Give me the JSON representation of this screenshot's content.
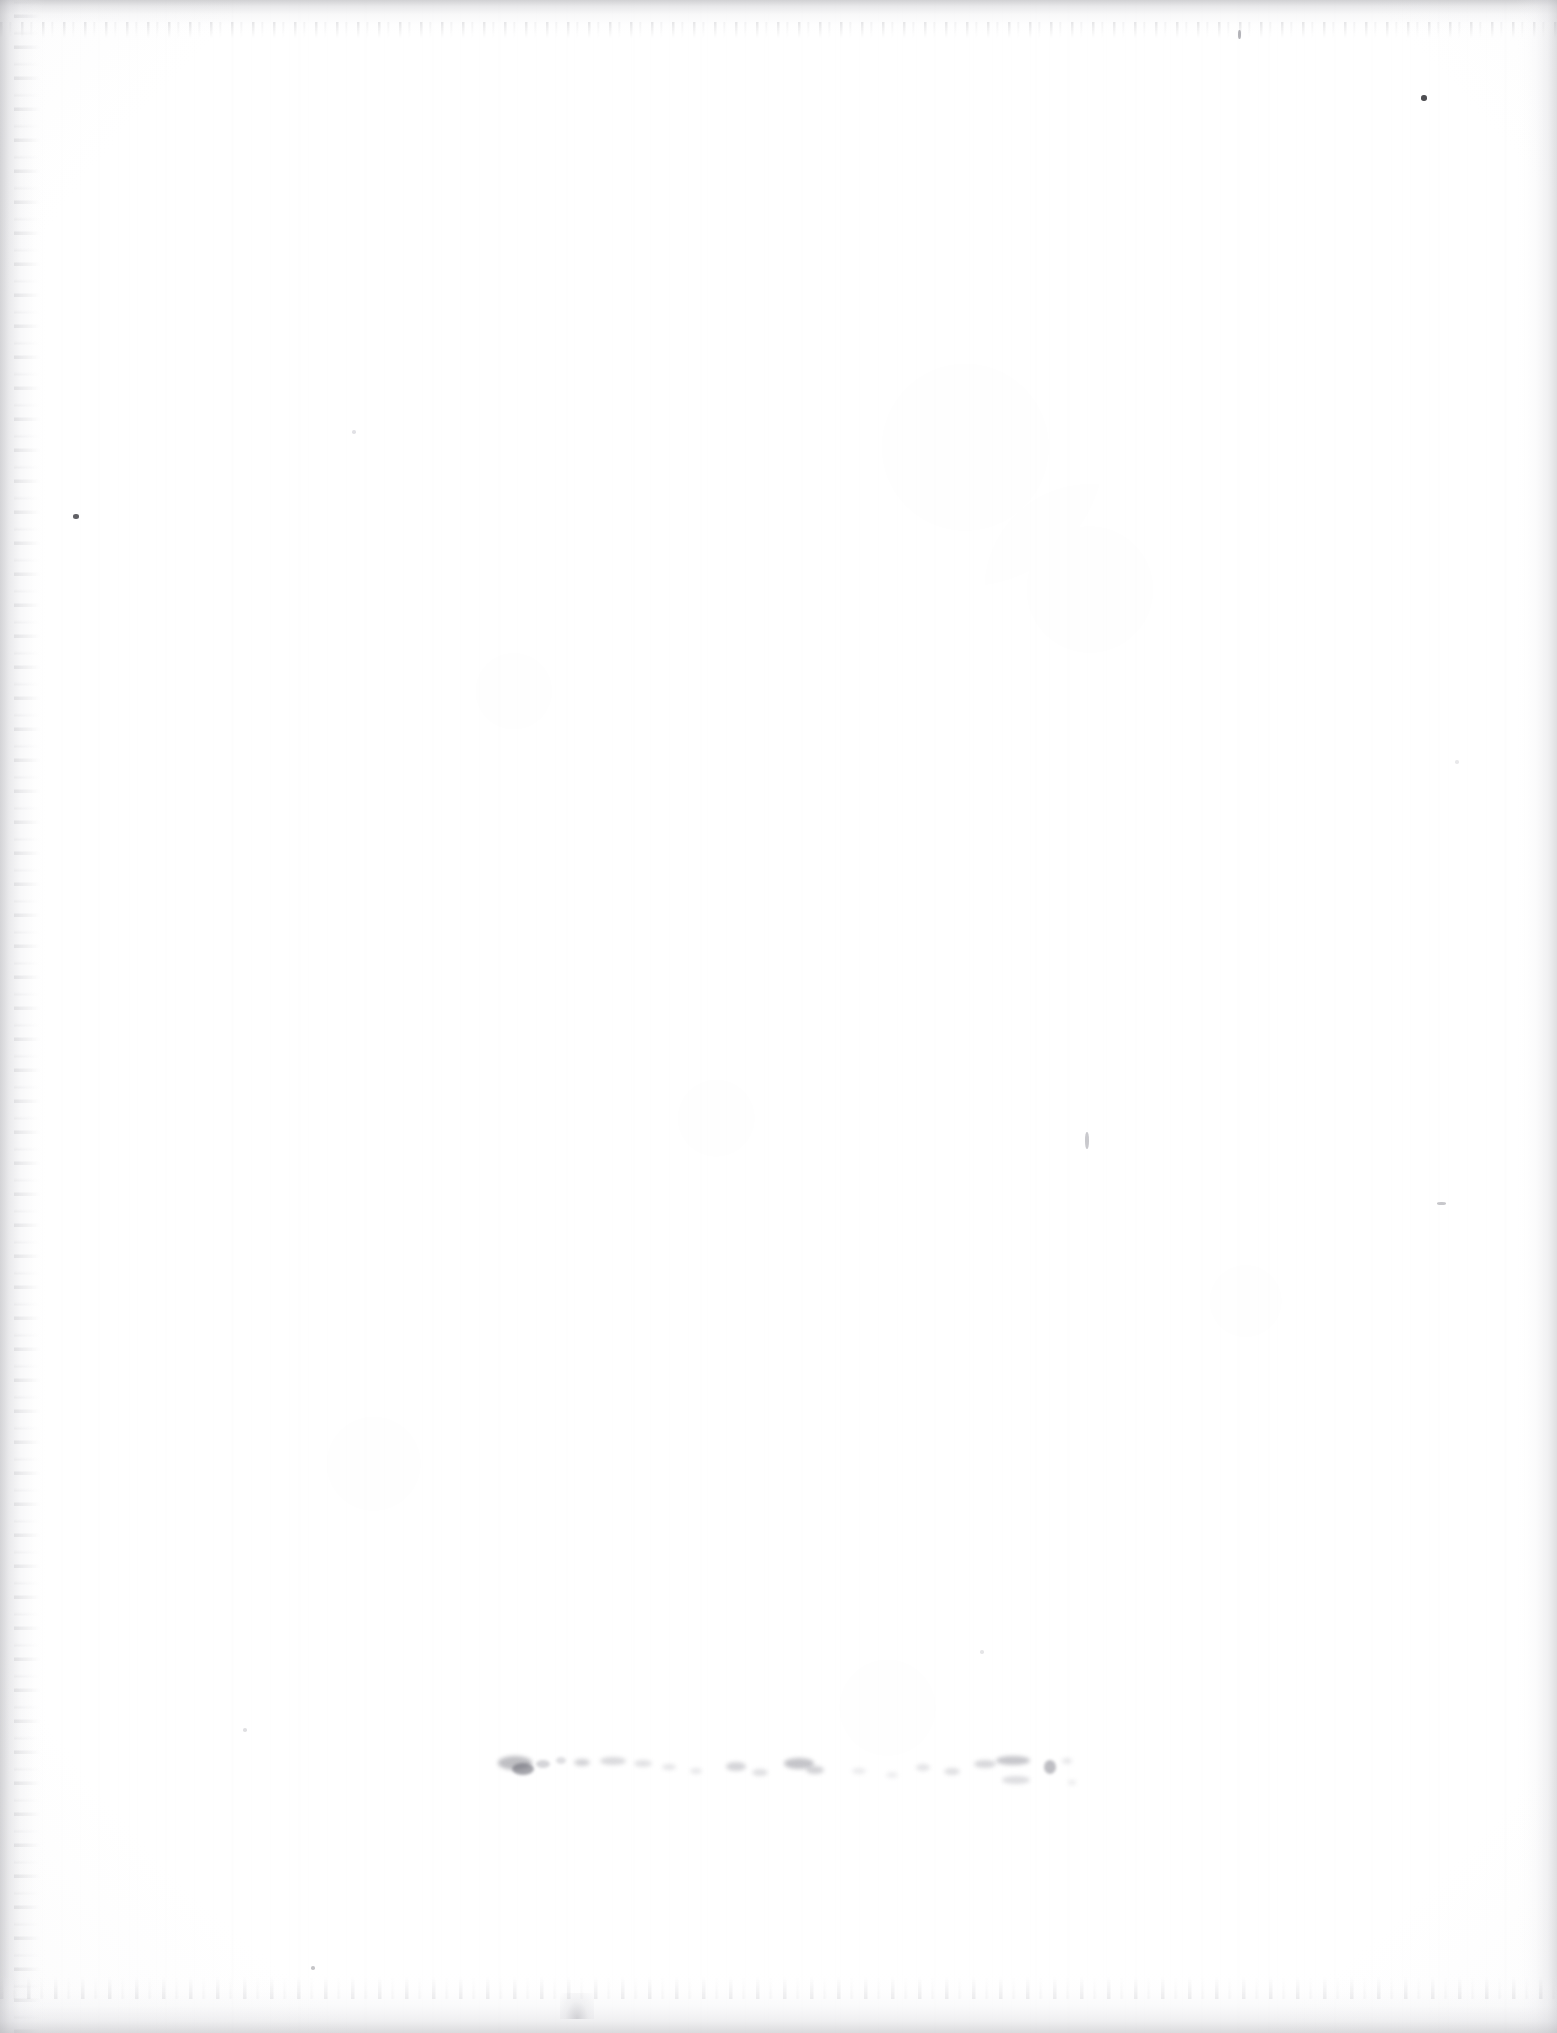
{
  "document": {
    "kind": "scanned-page",
    "page_content_text": "",
    "body_text": "",
    "is_blank": true,
    "width_px": 1557,
    "height_px": 2033,
    "background_color": "#fdfdfd",
    "paper_color": "#ffffff",
    "edge_shadow_color": "#b4b4b8",
    "ink_color": "#8e8e93",
    "dark_speck_color": "#2e2e33"
  },
  "artifacts": {
    "smudge_line": {
      "name": "bleed-through-smudge",
      "legible": false,
      "transcription": "",
      "description_text": "",
      "x_start": 498,
      "x_end": 1062,
      "y_center": 1768,
      "color": "#9a9aa0"
    },
    "specks": [
      {
        "name": "speck-top-right-dot",
        "x": 1421,
        "y": 95,
        "w": 6,
        "h": 6,
        "color": "#2f2f34",
        "opacity": 0.85
      },
      {
        "name": "speck-top-right-tick",
        "x": 1238,
        "y": 30,
        "w": 3,
        "h": 9,
        "color": "#9b9ba1",
        "opacity": 0.75
      },
      {
        "name": "speck-left-margin",
        "x": 73,
        "y": 514,
        "w": 6,
        "h": 5,
        "color": "#3a3a40",
        "opacity": 0.8
      },
      {
        "name": "speck-mid-right-stroke",
        "x": 1085,
        "y": 1132,
        "w": 4,
        "h": 17,
        "color": "#b2b2b8",
        "opacity": 0.7
      },
      {
        "name": "speck-right-dash",
        "x": 1437,
        "y": 1202,
        "w": 9,
        "h": 3,
        "color": "#a9a9af",
        "opacity": 0.65
      },
      {
        "name": "speck-upper-left-faint",
        "x": 352,
        "y": 430,
        "w": 4,
        "h": 4,
        "color": "#c9c9cf",
        "opacity": 0.55
      },
      {
        "name": "speck-lower-left-faint",
        "x": 243,
        "y": 1728,
        "w": 4,
        "h": 4,
        "color": "#c4c4ca",
        "opacity": 0.55
      },
      {
        "name": "speck-lower-mid-faint",
        "x": 980,
        "y": 1650,
        "w": 4,
        "h": 4,
        "color": "#cccccf",
        "opacity": 0.5
      },
      {
        "name": "speck-bottom-left-dot",
        "x": 311,
        "y": 1966,
        "w": 4,
        "h": 4,
        "color": "#9e9ea4",
        "opacity": 0.6
      },
      {
        "name": "speck-right-mid-faint",
        "x": 1455,
        "y": 760,
        "w": 4,
        "h": 4,
        "color": "#d2d2d6",
        "opacity": 0.5
      }
    ],
    "smudge_blobs": [
      {
        "x": 498,
        "y": 1756,
        "w": 34,
        "h": 14,
        "color": "#8a8a92",
        "opacity": 0.55,
        "blur": 2.0
      },
      {
        "x": 512,
        "y": 1763,
        "w": 22,
        "h": 12,
        "color": "#70707a",
        "opacity": 0.62,
        "blur": 1.6
      },
      {
        "x": 536,
        "y": 1760,
        "w": 14,
        "h": 8,
        "color": "#a2a2aa",
        "opacity": 0.45,
        "blur": 1.8
      },
      {
        "x": 556,
        "y": 1757,
        "w": 10,
        "h": 7,
        "color": "#aeaeb5",
        "opacity": 0.4,
        "blur": 1.8
      },
      {
        "x": 574,
        "y": 1759,
        "w": 16,
        "h": 7,
        "color": "#9b9ba3",
        "opacity": 0.45,
        "blur": 2.0
      },
      {
        "x": 600,
        "y": 1757,
        "w": 26,
        "h": 8,
        "color": "#a6a6ad",
        "opacity": 0.42,
        "blur": 2.2
      },
      {
        "x": 634,
        "y": 1760,
        "w": 18,
        "h": 7,
        "color": "#b0b0b7",
        "opacity": 0.38,
        "blur": 2.2
      },
      {
        "x": 662,
        "y": 1764,
        "w": 14,
        "h": 6,
        "color": "#b6b6bd",
        "opacity": 0.36,
        "blur": 2.0
      },
      {
        "x": 690,
        "y": 1768,
        "w": 12,
        "h": 6,
        "color": "#bcbcc2",
        "opacity": 0.34,
        "blur": 2.0
      },
      {
        "x": 726,
        "y": 1762,
        "w": 20,
        "h": 9,
        "color": "#9e9ea6",
        "opacity": 0.44,
        "blur": 2.2
      },
      {
        "x": 752,
        "y": 1769,
        "w": 16,
        "h": 7,
        "color": "#acacb3",
        "opacity": 0.38,
        "blur": 2.0
      },
      {
        "x": 784,
        "y": 1758,
        "w": 30,
        "h": 11,
        "color": "#8f8f98",
        "opacity": 0.52,
        "blur": 2.0
      },
      {
        "x": 806,
        "y": 1766,
        "w": 18,
        "h": 8,
        "color": "#9a9aa2",
        "opacity": 0.44,
        "blur": 2.0
      },
      {
        "x": 852,
        "y": 1768,
        "w": 14,
        "h": 6,
        "color": "#c0c0c6",
        "opacity": 0.32,
        "blur": 2.0
      },
      {
        "x": 886,
        "y": 1772,
        "w": 12,
        "h": 6,
        "color": "#c4c4ca",
        "opacity": 0.3,
        "blur": 2.0
      },
      {
        "x": 916,
        "y": 1764,
        "w": 14,
        "h": 7,
        "color": "#b4b4bb",
        "opacity": 0.36,
        "blur": 2.0
      },
      {
        "x": 944,
        "y": 1768,
        "w": 16,
        "h": 7,
        "color": "#adadb4",
        "opacity": 0.38,
        "blur": 2.0
      },
      {
        "x": 974,
        "y": 1760,
        "w": 22,
        "h": 8,
        "color": "#a0a0a8",
        "opacity": 0.42,
        "blur": 2.2
      },
      {
        "x": 996,
        "y": 1756,
        "w": 34,
        "h": 9,
        "color": "#8e8e97",
        "opacity": 0.5,
        "blur": 2.0
      },
      {
        "x": 1002,
        "y": 1776,
        "w": 28,
        "h": 8,
        "color": "#a8a8b0",
        "opacity": 0.38,
        "blur": 2.2
      },
      {
        "x": 1044,
        "y": 1760,
        "w": 12,
        "h": 14,
        "color": "#83838d",
        "opacity": 0.52,
        "blur": 1.8
      },
      {
        "x": 1062,
        "y": 1758,
        "w": 10,
        "h": 6,
        "color": "#b8b8be",
        "opacity": 0.34,
        "blur": 2.0
      },
      {
        "x": 1068,
        "y": 1780,
        "w": 8,
        "h": 5,
        "color": "#bdbdc3",
        "opacity": 0.3,
        "blur": 2.0
      }
    ]
  }
}
